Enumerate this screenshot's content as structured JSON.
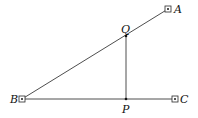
{
  "diagram": {
    "type": "geometry",
    "points": {
      "A": {
        "label": "A",
        "x": 168,
        "y": 9,
        "marker": "boxed-dot"
      },
      "B": {
        "label": "B",
        "x": 22,
        "y": 99,
        "marker": "boxed-dot"
      },
      "C": {
        "label": "C",
        "x": 175,
        "y": 99,
        "marker": "boxed-dot"
      },
      "Q": {
        "label": "Q",
        "x": 126,
        "y": 36,
        "marker": "dot"
      },
      "P": {
        "label": "P",
        "x": 126,
        "y": 99,
        "marker": "dot"
      }
    },
    "segments": [
      {
        "from": "B",
        "to": "A"
      },
      {
        "from": "B",
        "to": "C"
      },
      {
        "from": "Q",
        "to": "P"
      }
    ],
    "colors": {
      "line": "#3a3a3a",
      "text": "#111111",
      "background": "#ffffff"
    }
  }
}
